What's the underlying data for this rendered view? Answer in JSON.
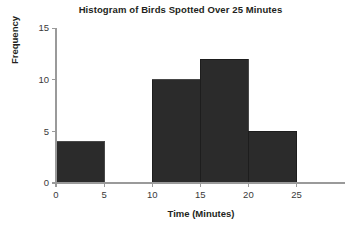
{
  "chart_data": {
    "type": "bar",
    "title": "Histogram of Birds Spotted Over 25 Minutes",
    "xlabel": "Time (Minutes)",
    "ylabel": "Frequency",
    "categories": [
      "0-5",
      "5-10",
      "10-15",
      "15-20",
      "20-25"
    ],
    "bin_edges": [
      0,
      5,
      10,
      15,
      20,
      25
    ],
    "values": [
      4,
      0,
      10,
      12,
      5
    ],
    "bin_width": 5,
    "xlim": [
      0,
      27
    ],
    "ylim": [
      0,
      15
    ],
    "xticks": [
      "0",
      "5",
      "10",
      "15",
      "20",
      "25"
    ],
    "xtick_values": [
      0,
      5,
      10,
      15,
      20,
      25
    ],
    "yticks": [
      "0",
      "5",
      "10",
      "15"
    ],
    "ytick_values": [
      0,
      5,
      10,
      15
    ],
    "grid": false,
    "legend": false,
    "bar_color": "#2b2b2b",
    "axis_color": "#9a9a9a",
    "text_color": "#231f20"
  }
}
